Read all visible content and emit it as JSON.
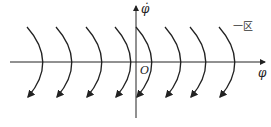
{
  "diagram": {
    "type": "phase-plane",
    "x_axis_label": "φ",
    "y_axis_label": "φ̇",
    "origin_label": "O",
    "zone_label": "一区",
    "trajectory_count": 8,
    "trajectory_x_positions": [
      48,
      77,
      107,
      136,
      157,
      186,
      211,
      240
    ],
    "colors": {
      "stroke": "#222222",
      "background": "#ffffff"
    }
  }
}
